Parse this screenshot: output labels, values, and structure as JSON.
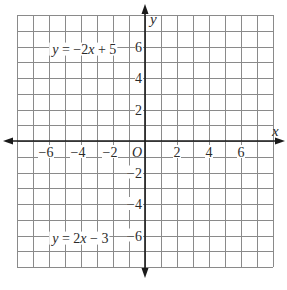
{
  "chart_data": {
    "type": "line",
    "title": "",
    "xlabel": "x",
    "ylabel": "y",
    "origin_label": "O",
    "xlim": [
      -8,
      8
    ],
    "ylim": [
      -8,
      8
    ],
    "grid": true,
    "grid_step": 1,
    "x_ticks": [
      -6,
      -4,
      -2,
      2,
      4,
      6
    ],
    "y_ticks": [
      6,
      4,
      2,
      -2,
      -4,
      -6
    ],
    "x_tick_labels": [
      "−6",
      "−4",
      "−2",
      "2",
      "4",
      "6"
    ],
    "y_tick_labels": [
      "6",
      "4",
      "2",
      "−2",
      "−4",
      "−6"
    ],
    "annotations": [
      {
        "text": "y = −2x + 5",
        "parts": [
          [
            "y",
            true
          ],
          [
            " = −2",
            false
          ],
          [
            "x",
            true
          ],
          [
            " + 5",
            false
          ]
        ],
        "x": -5.8,
        "y": 5.55
      },
      {
        "text": "y = 2x − 3",
        "parts": [
          [
            "y",
            true
          ],
          [
            " = 2",
            false
          ],
          [
            "x",
            true
          ],
          [
            " − 3",
            false
          ]
        ],
        "x": -5.8,
        "y": -6.45
      }
    ],
    "series": [],
    "legend": null
  },
  "colors": {
    "grid": "#8a8a8a",
    "axis": "#1a1a1a",
    "text": "#2a2a2a",
    "background": "#ffffff"
  }
}
